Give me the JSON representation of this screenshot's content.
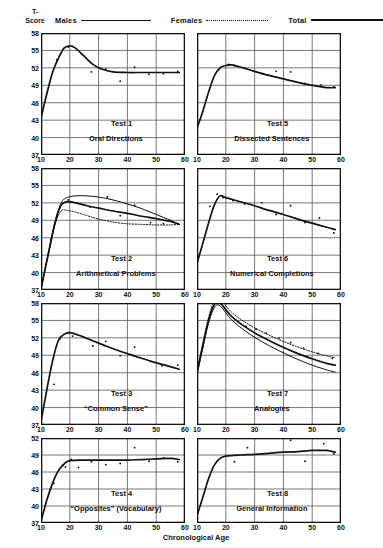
{
  "axes": {
    "y_title": "T-Score",
    "y_title_lines": [
      "T-",
      "Score"
    ],
    "x_title": "Chronological Age",
    "y_ticks": [
      58,
      55,
      52,
      49,
      46,
      43,
      40,
      37
    ],
    "x_ticks": [
      10,
      20,
      30,
      40,
      50,
      60
    ],
    "ylim": [
      37,
      58
    ],
    "xlim": [
      10,
      60
    ]
  },
  "legend": {
    "position": "top",
    "entries": [
      {
        "label": "Males",
        "style": "solid-thin",
        "icon": "line-solid-icon"
      },
      {
        "label": "Females",
        "style": "dotted",
        "icon": "line-dotted-icon"
      },
      {
        "label": "Total",
        "style": "solid-thick",
        "icon": "line-thick-icon"
      }
    ]
  },
  "colors": {
    "ink": "#111111",
    "grid": "#555555",
    "paper": "#ffffff"
  },
  "chart_data": [
    {
      "id": "test1",
      "type": "line",
      "title": "Test 1",
      "subtitle": "Oral Directions",
      "xlabel": "Chronological Age",
      "ylabel": "T-Score",
      "xlim": [
        10,
        60
      ],
      "ylim": [
        37,
        58
      ],
      "grid": true,
      "series": [
        {
          "name": "Total",
          "style": "solid-thick",
          "x": [
            10,
            12,
            14,
            16,
            18,
            20,
            22,
            25,
            28,
            31,
            35,
            40,
            45,
            50,
            55,
            58
          ],
          "y": [
            43.4,
            47.5,
            51.2,
            53.6,
            55.4,
            55.8,
            55.4,
            54.0,
            52.6,
            51.8,
            51.3,
            51.2,
            51.2,
            51.2,
            51.2,
            51.2
          ]
        }
      ],
      "points": [
        {
          "x": 10,
          "y": 42.6
        },
        {
          "x": 15.5,
          "y": 53.4
        },
        {
          "x": 19.5,
          "y": 55.6
        },
        {
          "x": 27.5,
          "y": 51.3
        },
        {
          "x": 32.5,
          "y": 51.8
        },
        {
          "x": 37.5,
          "y": 49.7
        },
        {
          "x": 42.5,
          "y": 52.1
        },
        {
          "x": 47.5,
          "y": 50.9
        },
        {
          "x": 52.5,
          "y": 51.0
        },
        {
          "x": 57.5,
          "y": 51.4
        }
      ]
    },
    {
      "id": "test5",
      "type": "line",
      "title": "Test 5",
      "subtitle": "Dissected Sentences",
      "xlabel": "Chronological Age",
      "ylabel": "T-Score",
      "xlim": [
        10,
        60
      ],
      "ylim": [
        37,
        58
      ],
      "grid": true,
      "series": [
        {
          "name": "Total",
          "style": "solid-thick",
          "x": [
            10,
            12,
            14,
            16,
            18,
            20,
            22,
            26,
            30,
            35,
            40,
            45,
            50,
            55,
            58
          ],
          "y": [
            41.6,
            44.5,
            47.8,
            50.6,
            52.0,
            52.4,
            52.5,
            52.0,
            51.4,
            50.7,
            50.1,
            49.5,
            49.0,
            48.6,
            48.6
          ]
        }
      ],
      "points": [
        {
          "x": 10,
          "y": 41.5
        },
        {
          "x": 17.5,
          "y": 51.7
        },
        {
          "x": 21,
          "y": 52.6
        },
        {
          "x": 23,
          "y": 52.4
        },
        {
          "x": 32.5,
          "y": 51.0
        },
        {
          "x": 37.5,
          "y": 51.4
        },
        {
          "x": 42.5,
          "y": 51.3
        },
        {
          "x": 47.5,
          "y": 49.3
        },
        {
          "x": 53,
          "y": 49.0
        },
        {
          "x": 57.5,
          "y": 48.7
        }
      ]
    },
    {
      "id": "test2",
      "type": "line",
      "title": "Test 2",
      "subtitle": "Arithmetical Problems",
      "xlabel": "Chronological Age",
      "ylabel": "T-Score",
      "xlim": [
        10,
        60
      ],
      "ylim": [
        37,
        58
      ],
      "grid": true,
      "series": [
        {
          "name": "Males",
          "style": "solid-thin",
          "x": [
            10,
            13,
            15,
            17,
            19,
            22,
            26,
            30,
            35,
            40,
            45,
            50,
            55,
            58
          ],
          "y": [
            37.2,
            44.5,
            49.0,
            52.0,
            52.9,
            53.2,
            53.2,
            53.0,
            52.5,
            51.8,
            51.0,
            50.0,
            49.0,
            48.3
          ]
        },
        {
          "name": "Total",
          "style": "solid-thick",
          "x": [
            10,
            13,
            15,
            17,
            19,
            22,
            26,
            30,
            35,
            40,
            45,
            50,
            55,
            58
          ],
          "y": [
            37.2,
            44.3,
            48.8,
            51.6,
            52.2,
            52.0,
            51.5,
            51.1,
            50.6,
            50.2,
            49.7,
            49.3,
            48.8,
            48.3
          ]
        },
        {
          "name": "Females",
          "style": "dotted",
          "x": [
            10,
            13,
            15,
            17,
            19,
            22,
            26,
            30,
            35,
            40,
            45,
            50,
            55,
            58
          ],
          "y": [
            37.2,
            44.1,
            48.5,
            50.6,
            50.7,
            50.4,
            49.8,
            49.2,
            48.7,
            48.4,
            48.3,
            48.2,
            48.2,
            48.3
          ]
        }
      ],
      "points": [
        {
          "x": 10,
          "y": 37.3
        },
        {
          "x": 13.5,
          "y": 45.8
        },
        {
          "x": 15.5,
          "y": 49.6
        },
        {
          "x": 19.5,
          "y": 52.5
        },
        {
          "x": 27,
          "y": 51.3
        },
        {
          "x": 33,
          "y": 53.0
        },
        {
          "x": 37.5,
          "y": 49.8
        },
        {
          "x": 42.5,
          "y": 51.6
        },
        {
          "x": 48,
          "y": 48.6
        },
        {
          "x": 52.5,
          "y": 48.4
        },
        {
          "x": 57.5,
          "y": 48.4
        }
      ]
    },
    {
      "id": "test6",
      "type": "line",
      "title": "Test 6",
      "subtitle": "Numerical Completions",
      "xlabel": "Chronological Age",
      "ylabel": "T-Score",
      "xlim": [
        10,
        60
      ],
      "ylim": [
        37,
        58
      ],
      "grid": true,
      "series": [
        {
          "name": "Total",
          "style": "solid-thick",
          "x": [
            10,
            12,
            14,
            16,
            18,
            20,
            25,
            30,
            35,
            40,
            45,
            50,
            55,
            58
          ],
          "y": [
            41.6,
            45.0,
            48.5,
            51.6,
            53.2,
            52.9,
            52.2,
            51.5,
            50.7,
            50.0,
            49.2,
            48.5,
            47.8,
            47.4
          ]
        }
      ],
      "points": [
        {
          "x": 10,
          "y": 41.6
        },
        {
          "x": 14.5,
          "y": 51.4
        },
        {
          "x": 17,
          "y": 53.5
        },
        {
          "x": 19,
          "y": 52.9
        },
        {
          "x": 22.5,
          "y": 52.4
        },
        {
          "x": 26.5,
          "y": 51.8
        },
        {
          "x": 32.5,
          "y": 52.0
        },
        {
          "x": 37.5,
          "y": 50.0
        },
        {
          "x": 42.5,
          "y": 51.5
        },
        {
          "x": 47.5,
          "y": 48.6
        },
        {
          "x": 52.5,
          "y": 49.4
        },
        {
          "x": 57.5,
          "y": 46.8
        }
      ]
    },
    {
      "id": "test3",
      "type": "line",
      "title": "Test 3",
      "subtitle": "“Common Sense”",
      "xlabel": "Chronological Age",
      "ylabel": "T-Score",
      "xlim": [
        10,
        60
      ],
      "ylim": [
        37,
        58
      ],
      "grid": true,
      "series": [
        {
          "name": "Total",
          "style": "solid-thick",
          "x": [
            10,
            12,
            14,
            16,
            18,
            20,
            24,
            28,
            33,
            38,
            43,
            48,
            53,
            58
          ],
          "y": [
            37.6,
            43.0,
            48.0,
            51.5,
            52.6,
            52.9,
            52.3,
            51.5,
            50.5,
            49.6,
            48.8,
            48.0,
            47.3,
            46.6
          ]
        }
      ],
      "points": [
        {
          "x": 10,
          "y": 38.0
        },
        {
          "x": 14.5,
          "y": 44.0
        },
        {
          "x": 16.5,
          "y": 51.8
        },
        {
          "x": 19.5,
          "y": 52.9
        },
        {
          "x": 21,
          "y": 52.3
        },
        {
          "x": 28,
          "y": 50.6
        },
        {
          "x": 32.5,
          "y": 51.4
        },
        {
          "x": 37.5,
          "y": 48.9
        },
        {
          "x": 42.5,
          "y": 50.4
        },
        {
          "x": 52,
          "y": 47.2
        },
        {
          "x": 57.5,
          "y": 47.3
        }
      ]
    },
    {
      "id": "test7",
      "type": "line",
      "title": "Test 7",
      "subtitle": "Analogies",
      "xlabel": "Chronological Age",
      "ylabel": "T-Score",
      "xlim": [
        10,
        60
      ],
      "ylim": [
        37,
        58
      ],
      "grid": true,
      "series": [
        {
          "name": "Females",
          "style": "dotted",
          "x": [
            10,
            12,
            14,
            16,
            18,
            22,
            27,
            32,
            38,
            44,
            50,
            55,
            58
          ],
          "y": [
            46.4,
            51.0,
            55.5,
            58.3,
            58.6,
            56.4,
            54.6,
            53.2,
            51.8,
            50.6,
            49.6,
            48.9,
            48.6
          ]
        },
        {
          "name": "Total",
          "style": "solid-thick",
          "x": [
            10,
            12,
            14,
            16,
            18,
            22,
            27,
            32,
            38,
            44,
            50,
            55,
            58
          ],
          "y": [
            46.0,
            50.6,
            55.0,
            57.7,
            58.0,
            55.7,
            53.8,
            52.3,
            50.8,
            49.5,
            48.4,
            47.6,
            47.3
          ]
        },
        {
          "name": "Males",
          "style": "solid-thin",
          "x": [
            10,
            12,
            14,
            16,
            18,
            22,
            27,
            32,
            38,
            44,
            50,
            55,
            58
          ],
          "y": [
            45.6,
            50.2,
            54.5,
            57.2,
            57.5,
            55.1,
            53.1,
            51.5,
            49.9,
            48.5,
            47.3,
            46.5,
            46.1
          ]
        }
      ],
      "points": [
        {
          "x": 27,
          "y": 54.0
        },
        {
          "x": 30.5,
          "y": 53.5
        },
        {
          "x": 34,
          "y": 52.8
        },
        {
          "x": 38.5,
          "y": 52.0
        },
        {
          "x": 42.5,
          "y": 51.2
        },
        {
          "x": 47,
          "y": 50.2
        },
        {
          "x": 52,
          "y": 49.3
        },
        {
          "x": 57,
          "y": 48.5
        }
      ]
    },
    {
      "id": "test4",
      "type": "line",
      "title": "Test 4",
      "subtitle": "“Opposites” (Vocabulary)",
      "xlabel": "Chronological Age",
      "ylabel": "T-Score",
      "xlim": [
        37,
        58
      ],
      "ylim": [
        37,
        58
      ],
      "grid": true,
      "series": [
        {
          "name": "Total",
          "style": "solid-thick",
          "x": [
            10,
            12,
            14,
            16,
            18,
            20,
            25,
            30,
            35,
            40,
            45,
            50,
            55,
            58
          ],
          "y": [
            37.3,
            41.0,
            44.0,
            46.2,
            47.4,
            48.0,
            48.1,
            48.1,
            48.1,
            48.1,
            48.2,
            48.3,
            48.4,
            48.2
          ]
        }
      ],
      "points": [
        {
          "x": 10,
          "y": 37.4
        },
        {
          "x": 14.5,
          "y": 44.0
        },
        {
          "x": 17.5,
          "y": 47.2
        },
        {
          "x": 18.5,
          "y": 46.9
        },
        {
          "x": 20.5,
          "y": 48.2
        },
        {
          "x": 23,
          "y": 46.8
        },
        {
          "x": 27.5,
          "y": 47.8
        },
        {
          "x": 32.5,
          "y": 47.3
        },
        {
          "x": 37.5,
          "y": 47.5
        },
        {
          "x": 42.5,
          "y": 50.3
        },
        {
          "x": 47.5,
          "y": 47.9
        },
        {
          "x": 52.5,
          "y": 48.5
        },
        {
          "x": 57.5,
          "y": 47.8
        }
      ]
    },
    {
      "id": "test8",
      "type": "line",
      "title": "Test 8",
      "subtitle": "General Information",
      "xlabel": "Chronological Age",
      "ylabel": "T-Score",
      "xlim": [
        10,
        60
      ],
      "ylim": [
        37,
        58
      ],
      "grid": true,
      "series": [
        {
          "name": "Total",
          "style": "solid-thick",
          "x": [
            10,
            12,
            14,
            16,
            18,
            20,
            25,
            30,
            35,
            40,
            45,
            50,
            55,
            58
          ],
          "y": [
            38.3,
            41.5,
            44.8,
            47.2,
            48.4,
            48.8,
            49.0,
            49.1,
            49.3,
            49.5,
            49.6,
            49.8,
            49.8,
            49.5
          ]
        }
      ],
      "points": [
        {
          "x": 10,
          "y": 38.5
        },
        {
          "x": 23,
          "y": 47.8
        },
        {
          "x": 27.5,
          "y": 50.3
        },
        {
          "x": 33,
          "y": 49.2
        },
        {
          "x": 42.5,
          "y": 51.6
        },
        {
          "x": 47.5,
          "y": 47.9
        },
        {
          "x": 54,
          "y": 51.0
        },
        {
          "x": 57.5,
          "y": 49.2
        }
      ]
    }
  ]
}
